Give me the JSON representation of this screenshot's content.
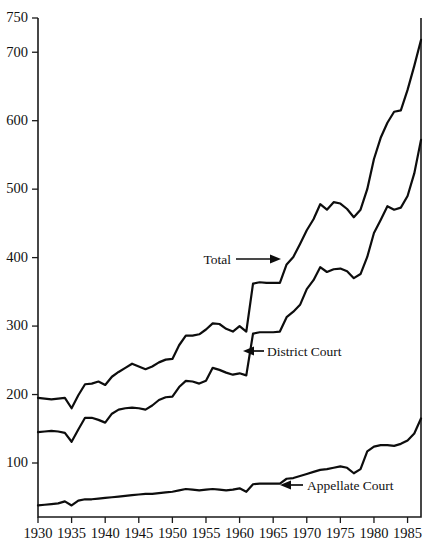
{
  "chart_data": {
    "type": "line",
    "title": "",
    "subtitle": "",
    "xlabel": "",
    "ylabel": "",
    "xlim": [
      1930,
      1987
    ],
    "ylim": [
      0,
      750
    ],
    "grid": false,
    "legend_position": "inline-annotations",
    "y_ticks": [
      100,
      200,
      300,
      400,
      500,
      600,
      700,
      750
    ],
    "y_tick_labels": [
      "100",
      "200",
      "300",
      "400",
      "500",
      "600",
      "700",
      "750"
    ],
    "x_ticks": [
      1930,
      1935,
      1940,
      1945,
      1950,
      1955,
      1960,
      1965,
      1970,
      1975,
      1980,
      1985
    ],
    "x_tick_labels": [
      "1930",
      "1935",
      "1940",
      "1945",
      "1950",
      "1955",
      "1960",
      "1965",
      "1970",
      "1975",
      "1980",
      "1985"
    ],
    "x": [
      1930,
      1931,
      1932,
      1933,
      1934,
      1935,
      1936,
      1937,
      1938,
      1939,
      1940,
      1941,
      1942,
      1943,
      1944,
      1945,
      1946,
      1947,
      1948,
      1949,
      1950,
      1951,
      1952,
      1953,
      1954,
      1955,
      1956,
      1957,
      1958,
      1959,
      1960,
      1961,
      1962,
      1963,
      1964,
      1965,
      1966,
      1967,
      1968,
      1969,
      1970,
      1971,
      1972,
      1973,
      1974,
      1975,
      1976,
      1977,
      1978,
      1979,
      1980,
      1981,
      1982,
      1983,
      1984,
      1985,
      1986,
      1987
    ],
    "series": [
      {
        "name": "Total",
        "label": "Total",
        "color": "#0d0d0d",
        "values": [
          195,
          194,
          193,
          194,
          195,
          180,
          199,
          215,
          216,
          219,
          214,
          226,
          233,
          239,
          245,
          241,
          237,
          241,
          247,
          251,
          252,
          272,
          286,
          286,
          288,
          295,
          304,
          303,
          296,
          292,
          300,
          292,
          362,
          364,
          363,
          363,
          363,
          390,
          401,
          420,
          440,
          456,
          478,
          470,
          481,
          479,
          471,
          459,
          470,
          500,
          544,
          575,
          597,
          613,
          615,
          645,
          680,
          718
        ]
      },
      {
        "name": "District Court",
        "label": "District Court",
        "color": "#0d0d0d",
        "values": [
          145,
          146,
          147,
          146,
          144,
          131,
          149,
          166,
          166,
          163,
          159,
          172,
          178,
          180,
          181,
          180,
          178,
          184,
          192,
          196,
          197,
          211,
          220,
          219,
          216,
          220,
          239,
          236,
          232,
          229,
          231,
          228,
          289,
          291,
          291,
          291,
          292,
          313,
          321,
          331,
          354,
          367,
          386,
          379,
          383,
          384,
          380,
          370,
          376,
          401,
          436,
          455,
          475,
          470,
          473,
          490,
          523,
          572
        ]
      },
      {
        "name": "Appellate Court",
        "label": "Appellate Court",
        "color": "#0d0d0d",
        "values": [
          38,
          39,
          40,
          41,
          44,
          38,
          45,
          47,
          47,
          48,
          49,
          50,
          51,
          52,
          53,
          54,
          55,
          55,
          56,
          57,
          58,
          60,
          62,
          61,
          60,
          61,
          62,
          61,
          60,
          61,
          63,
          58,
          69,
          70,
          70,
          70,
          70,
          77,
          78,
          81,
          84,
          87,
          90,
          91,
          93,
          95,
          93,
          85,
          91,
          117,
          124,
          126,
          126,
          125,
          128,
          133,
          143,
          165
        ]
      }
    ],
    "annotations": [
      {
        "name": "total-annotation",
        "text": "Total",
        "arrow_direction": "right",
        "points_at_series": "Total"
      },
      {
        "name": "district-court-annotation",
        "text": "District Court",
        "arrow_direction": "left",
        "points_at_series": "District Court"
      },
      {
        "name": "appellate-court-annotation",
        "text": "Appellate Court",
        "arrow_direction": "left",
        "points_at_series": "Appellate Court"
      }
    ]
  }
}
